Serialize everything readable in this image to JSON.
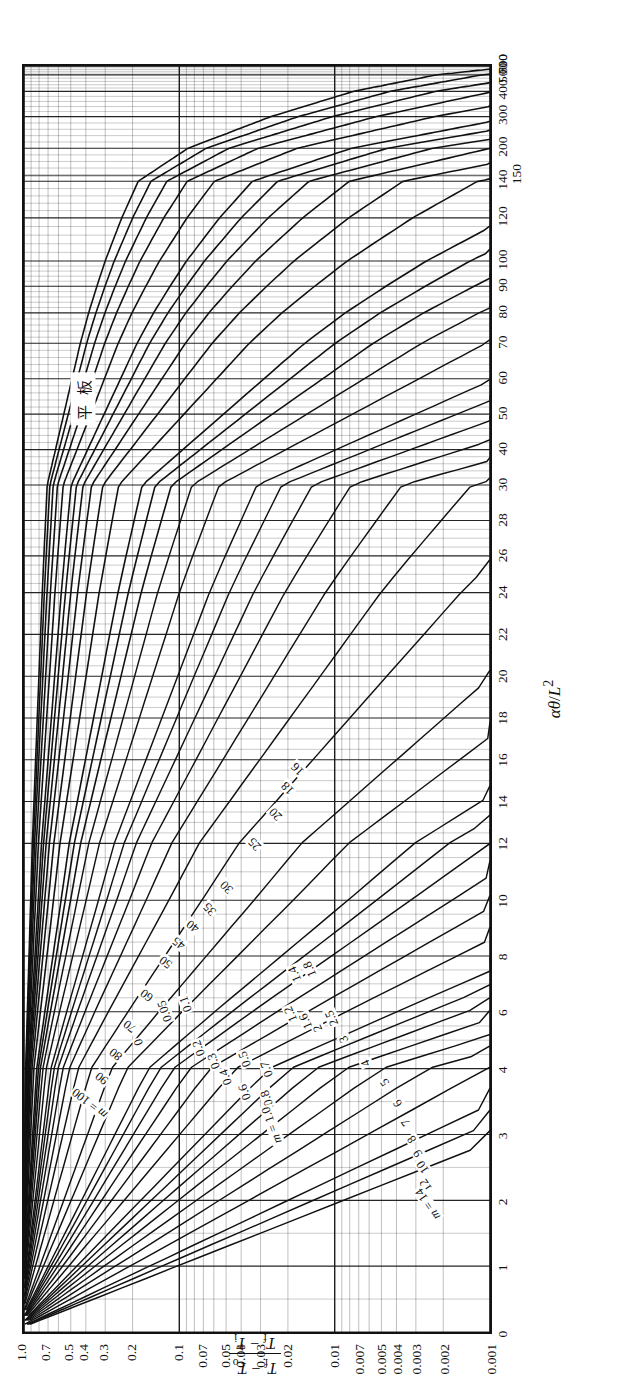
{
  "chart": {
    "type": "line",
    "title": "",
    "annotation": "平 板",
    "xlabel_alpha": "α",
    "xlabel_theta": "θ",
    "xlabel_div": "/",
    "xlabel_L": "L",
    "xlabel_exp": "2",
    "ylabel_num_a": "T",
    "ylabel_num_sub_a": "f",
    "ylabel_num_minus": " − ",
    "ylabel_num_b": "T",
    "ylabel_num_sub_b": "o",
    "ylabel_den_a": "T",
    "ylabel_den_sub_a": "f",
    "ylabel_den_minus": " − ",
    "ylabel_den_b": "T",
    "ylabel_den_sub_b": "i",
    "series_prefix": "m =",
    "grid": true,
    "legend_position": "inline-curve-labels"
  },
  "chart_data": {
    "type": "line",
    "annotation": "平 板",
    "xlabel": "αθ/L²",
    "ylabel": "(T_f − T_o)/(T_f − T_i)",
    "grid": true,
    "xscale": "piecewise-compressed",
    "yscale": "log",
    "ylim": [
      0.001,
      1.0
    ],
    "xlim": [
      0,
      700
    ],
    "xticks": [
      {
        "v": 0,
        "label": "0",
        "pos": 0.0
      },
      {
        "v": 1,
        "label": "1",
        "pos": 0.052
      },
      {
        "v": 2,
        "label": "2",
        "pos": 0.104
      },
      {
        "v": 3,
        "label": "3",
        "pos": 0.156
      },
      {
        "v": 4,
        "label": "4",
        "pos": 0.208
      },
      {
        "v": 6,
        "label": "6",
        "pos": 0.253
      },
      {
        "v": 8,
        "label": "8",
        "pos": 0.297
      },
      {
        "v": 10,
        "label": "10",
        "pos": 0.341
      },
      {
        "v": 12,
        "label": "12",
        "pos": 0.386
      },
      {
        "v": 14,
        "label": "14",
        "pos": 0.419
      },
      {
        "v": 16,
        "label": "16",
        "pos": 0.452
      },
      {
        "v": 18,
        "label": "18",
        "pos": 0.485
      },
      {
        "v": 20,
        "label": "20",
        "pos": 0.518
      },
      {
        "v": 22,
        "label": "22",
        "pos": 0.551
      },
      {
        "v": 24,
        "label": "24",
        "pos": 0.584
      },
      {
        "v": 26,
        "label": "26",
        "pos": 0.613
      },
      {
        "v": 28,
        "label": "28",
        "pos": 0.641
      },
      {
        "v": 30,
        "label": "30",
        "pos": 0.669
      },
      {
        "v": 40,
        "label": "40",
        "pos": 0.697
      },
      {
        "v": 50,
        "label": "50",
        "pos": 0.725
      },
      {
        "v": 60,
        "label": "60",
        "pos": 0.753
      },
      {
        "v": 70,
        "label": "70",
        "pos": 0.781
      },
      {
        "v": 80,
        "label": "80",
        "pos": 0.805
      },
      {
        "v": 90,
        "label": "90",
        "pos": 0.826
      },
      {
        "v": 100,
        "label": "100",
        "pos": 0.846
      },
      {
        "v": 120,
        "label": "120",
        "pos": 0.88
      },
      {
        "v": 140,
        "label": "140",
        "pos": 0.909
      },
      {
        "v": 200,
        "label": "200",
        "pos": 0.935
      },
      {
        "v": 300,
        "label": "300",
        "pos": 0.96
      },
      {
        "v": 400,
        "label": "400",
        "pos": 0.98
      },
      {
        "v": 500,
        "label": "500",
        "pos": 0.993
      },
      {
        "v": 600,
        "label": "600",
        "pos": 1.0
      },
      {
        "v": 700,
        "label": "700",
        "pos": 1.0
      }
    ],
    "xticks_low": [
      {
        "v": 150,
        "label": "150",
        "pos": 0.922
      }
    ],
    "yticks": [
      {
        "v": 1.0,
        "label": "1.0"
      },
      {
        "v": 0.7,
        "label": "0.7"
      },
      {
        "v": 0.5,
        "label": "0.5"
      },
      {
        "v": 0.4,
        "label": "0.4"
      },
      {
        "v": 0.3,
        "label": "0.3"
      },
      {
        "v": 0.2,
        "label": "0.2"
      },
      {
        "v": 0.1,
        "label": "0.1"
      },
      {
        "v": 0.07,
        "label": "0.07"
      },
      {
        "v": 0.05,
        "label": "0.05"
      },
      {
        "v": 0.04,
        "label": "0.04"
      },
      {
        "v": 0.03,
        "label": "0.03"
      },
      {
        "v": 0.02,
        "label": "0.02"
      },
      {
        "v": 0.01,
        "label": "0.01"
      },
      {
        "v": 0.007,
        "label": "0.007"
      },
      {
        "v": 0.005,
        "label": "0.005"
      },
      {
        "v": 0.004,
        "label": "0.004"
      },
      {
        "v": 0.003,
        "label": "0.003"
      },
      {
        "v": 0.002,
        "label": "0.002"
      },
      {
        "v": 0.001,
        "label": "0.001"
      }
    ],
    "series_parameter": "m",
    "series": [
      {
        "name": "m = 0",
        "label": "0",
        "m": 0,
        "lx": 0.228,
        "ly": 0.245
      },
      {
        "name": "m = 0.05",
        "label": "0.05",
        "m": 0.05,
        "lx": 0.253,
        "ly": 0.3
      },
      {
        "name": "m = 0.1",
        "label": "0.1",
        "m": 0.1,
        "lx": 0.258,
        "ly": 0.345
      },
      {
        "name": "m = 0.2",
        "label": "0.2",
        "m": 0.2,
        "lx": 0.224,
        "ly": 0.372
      },
      {
        "name": "m = 0.3",
        "label": "0.3",
        "m": 0.3,
        "lx": 0.213,
        "ly": 0.405
      },
      {
        "name": "m = 0.4",
        "label": "0.4",
        "m": 0.4,
        "lx": 0.201,
        "ly": 0.43
      },
      {
        "name": "m = 0.5",
        "label": "0.5",
        "m": 0.5,
        "lx": 0.215,
        "ly": 0.47
      },
      {
        "name": "m = 0.6",
        "label": "0.6",
        "m": 0.6,
        "lx": 0.189,
        "ly": 0.47
      },
      {
        "name": "m = 0.7",
        "label": "0.7",
        "m": 0.7,
        "lx": 0.207,
        "ly": 0.517
      },
      {
        "name": "m = 0.8",
        "label": "0.8",
        "m": 0.8,
        "lx": 0.184,
        "ly": 0.517
      },
      {
        "name": "m = 1.0",
        "label": "1.0",
        "m": 1.0,
        "lx": 0.163,
        "ly": 0.527
      },
      {
        "name": "m = 1.2",
        "label": "1.2",
        "m": 1.2,
        "lx": 0.25,
        "ly": 0.568
      },
      {
        "name": "m = 1.4",
        "label": "1.4",
        "m": 1.4,
        "lx": 0.282,
        "ly": 0.577
      },
      {
        "name": "m = 1.6",
        "label": "1.6",
        "m": 1.6,
        "lx": 0.245,
        "ly": 0.6
      },
      {
        "name": "m = 1.8",
        "label": "1.8",
        "m": 1.8,
        "lx": 0.286,
        "ly": 0.608
      },
      {
        "name": "m = 2",
        "label": "2",
        "m": 2,
        "lx": 0.239,
        "ly": 0.625
      },
      {
        "name": "m = 2.5",
        "label": "2.5",
        "m": 2.5,
        "lx": 0.247,
        "ly": 0.655
      },
      {
        "name": "m = 3",
        "label": "3",
        "m": 3,
        "lx": 0.231,
        "ly": 0.68
      },
      {
        "name": "m = 4",
        "label": "4",
        "m": 4,
        "lx": 0.212,
        "ly": 0.727
      },
      {
        "name": "m = 5",
        "label": "5",
        "m": 5,
        "lx": 0.197,
        "ly": 0.768
      },
      {
        "name": "m = 6",
        "label": "6",
        "m": 6,
        "lx": 0.18,
        "ly": 0.795
      },
      {
        "name": "m = 7",
        "label": "7",
        "m": 7,
        "lx": 0.165,
        "ly": 0.812
      },
      {
        "name": "m = 8",
        "label": "8",
        "m": 8,
        "lx": 0.152,
        "ly": 0.826
      },
      {
        "name": "m = 9",
        "label": "9",
        "m": 9,
        "lx": 0.141,
        "ly": 0.838
      },
      {
        "name": "m = 10",
        "label": "10",
        "m": 10,
        "lx": 0.13,
        "ly": 0.848
      },
      {
        "name": "m = 12",
        "label": "12",
        "m": 12,
        "lx": 0.116,
        "ly": 0.855
      },
      {
        "name": "m = 14",
        "label": "14",
        "m": 14,
        "lx": 0.101,
        "ly": 0.86
      },
      {
        "name": "m = 16",
        "label": "16",
        "m": 16,
        "lx": 0.443,
        "ly": 0.584
      },
      {
        "name": "m = 18",
        "label": "18",
        "m": 18,
        "lx": 0.428,
        "ly": 0.562
      },
      {
        "name": "m = 20",
        "label": "20",
        "m": 20,
        "lx": 0.408,
        "ly": 0.536
      },
      {
        "name": "m = 25",
        "label": "25",
        "m": 25,
        "lx": 0.384,
        "ly": 0.492
      },
      {
        "name": "m = 30",
        "label": "30",
        "m": 30,
        "lx": 0.35,
        "ly": 0.432
      },
      {
        "name": "m = 35",
        "label": "35",
        "m": 35,
        "lx": 0.333,
        "ly": 0.396
      },
      {
        "name": "m = 40",
        "label": "40",
        "m": 40,
        "lx": 0.32,
        "ly": 0.36
      },
      {
        "name": "m = 45",
        "label": "45",
        "m": 45,
        "lx": 0.306,
        "ly": 0.33
      },
      {
        "name": "m = 50",
        "label": "50",
        "m": 50,
        "lx": 0.291,
        "ly": 0.302
      },
      {
        "name": "m = 60",
        "label": "60",
        "m": 60,
        "lx": 0.265,
        "ly": 0.262
      },
      {
        "name": "m = 70",
        "label": "70",
        "m": 70,
        "lx": 0.241,
        "ly": 0.226
      },
      {
        "name": "m = 80",
        "label": "80",
        "m": 80,
        "lx": 0.219,
        "ly": 0.195
      },
      {
        "name": "m = 90",
        "label": "90",
        "m": 90,
        "lx": 0.2,
        "ly": 0.166
      },
      {
        "name": "m = 100",
        "label": "100",
        "m": 100,
        "lx": 0.18,
        "ly": 0.14
      }
    ]
  }
}
